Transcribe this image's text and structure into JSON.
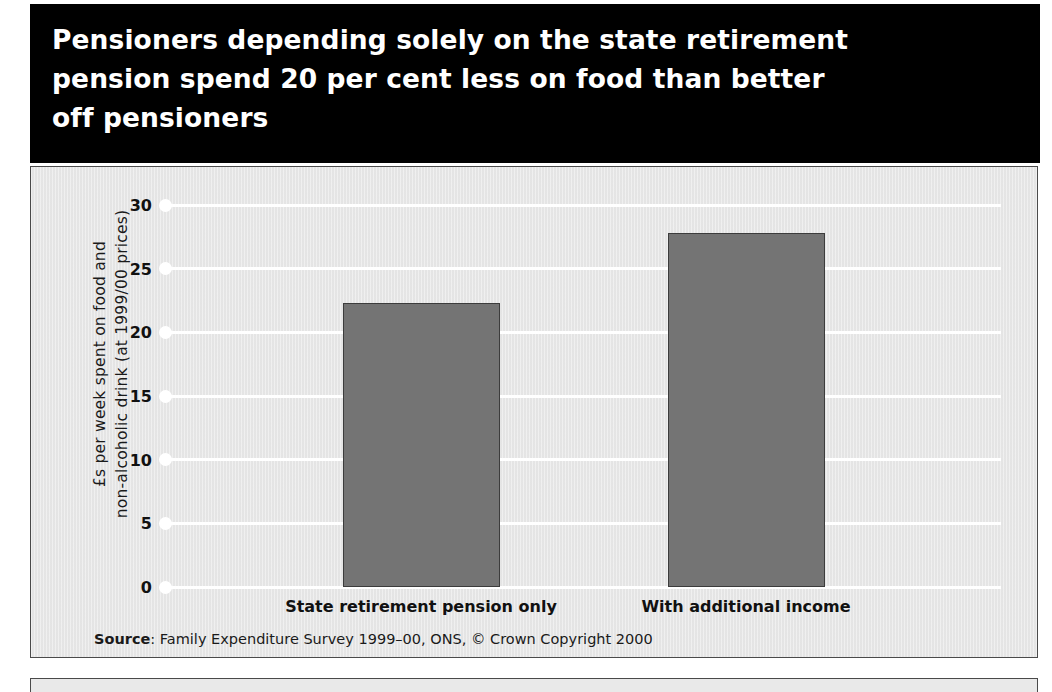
{
  "title": {
    "lines": [
      "Pensioners depending solely on the state retirement",
      "pension spend 20 per cent less on food than better",
      "off pensioners"
    ]
  },
  "source": {
    "label": "Source",
    "text": ": Family Expenditure Survey 1999–00, ONS, © Crown Copyright 2000"
  },
  "colors": {
    "banner_background": "#000000",
    "banner_text": "#ffffff",
    "panel_background": "#e9e9e9",
    "bar_fill": "#747474",
    "bar_stroke": "#3c3c3c",
    "gridline": "#ffffff",
    "panel_border": "#4a4a4a"
  },
  "chart_data": {
    "type": "bar",
    "title": "Pensioners depending solely on the state retirement pension spend 20 per cent less on food than better off pensioners",
    "categories": [
      "State retirement pension only",
      "With additional income"
    ],
    "values": [
      22.3,
      27.8
    ],
    "xlabel": "",
    "ylabel": "£s per week spent on food and non-alcoholic drink (at 1999/00 prices)",
    "ylabel_lines": [
      "£s per week spent on food and",
      "non-alcoholic drink (at 1999/00 prices)"
    ],
    "ylim": [
      0,
      30
    ],
    "yticks": [
      0,
      5,
      10,
      15,
      20,
      25,
      30
    ],
    "ytick_labels": [
      "0",
      "5",
      "10",
      "15",
      "20",
      "25",
      "30"
    ],
    "grid": true,
    "legend": false,
    "source": "Source: Family Expenditure Survey 1999–00, ONS, © Crown Copyright 2000"
  }
}
